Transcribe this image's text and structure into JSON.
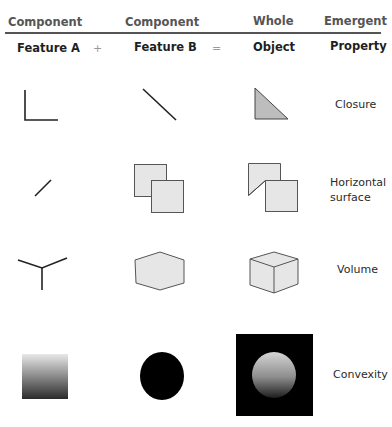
{
  "header": {
    "columns": [
      "Component",
      "Component",
      "Whole",
      "Emergent"
    ]
  },
  "subheader": {
    "columns": [
      "Feature A",
      "Feature B",
      "Object",
      "Property"
    ],
    "operators": [
      "+",
      "="
    ]
  },
  "rows": [
    {
      "feature_a": "corner-lines",
      "feature_b": "diagonal-line",
      "object": "right-triangle",
      "property": "Closure"
    },
    {
      "feature_a": "short-oblique-line",
      "feature_b": "overlapping-squares",
      "object": "folded-squares",
      "property_line1": "Horizontal",
      "property_line2": "surface"
    },
    {
      "feature_a": "y-junction",
      "feature_b": "hexagon",
      "object": "cube",
      "property": "Volume"
    },
    {
      "feature_a": "shaded-gradient-square",
      "feature_b": "black-ellipse",
      "object": "shaded-sphere-on-black",
      "property": "Convexity"
    }
  ],
  "colors": {
    "header_text": "#555555",
    "rule": "#555555",
    "shape_fill": "#e6e6e6",
    "triangle_fill": "#bdbdbd",
    "stroke": "#222222",
    "black": "#000000"
  }
}
